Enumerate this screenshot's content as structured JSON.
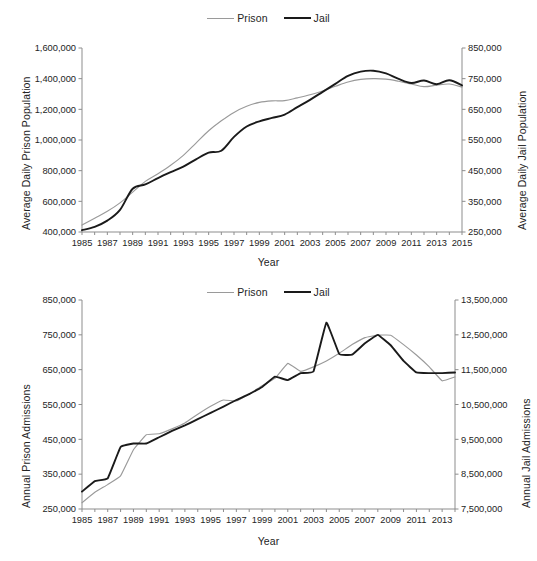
{
  "figures": [
    {
      "id": "average-daily-population",
      "legend": [
        {
          "label": "Prison",
          "color": "#9a9a9a",
          "series": "prison"
        },
        {
          "label": "Jail",
          "color": "#1a1a1a",
          "series": "jail"
        }
      ],
      "chart_data": {
        "type": "line",
        "title": "",
        "xlabel": "Year",
        "ylabel": "Average Daily Prison Population",
        "y2label": "Average Daily Jail Population",
        "grid": false,
        "legend_position": "top-center",
        "x": [
          1985,
          1986,
          1987,
          1988,
          1989,
          1990,
          1991,
          1992,
          1993,
          1994,
          1995,
          1996,
          1997,
          1998,
          1999,
          2000,
          2001,
          2002,
          2003,
          2004,
          2005,
          2006,
          2007,
          2008,
          2009,
          2010,
          2011,
          2012,
          2013,
          2014,
          2015
        ],
        "xlim": [
          1985,
          2015
        ],
        "xticks": [
          1985,
          1987,
          1989,
          1991,
          1993,
          1995,
          1997,
          1999,
          2001,
          2003,
          2005,
          2007,
          2009,
          2011,
          2013,
          2015
        ],
        "xticklabels": [
          "1985",
          "1987",
          "1989",
          "1991",
          "1993",
          "1995",
          "1997",
          "1999",
          "2001",
          "2003",
          "2005",
          "2007",
          "2009",
          "2011",
          "2013",
          "2015"
        ],
        "ylim": [
          400000,
          1600000
        ],
        "yticks": [
          400000,
          600000,
          800000,
          1000000,
          1200000,
          1400000,
          1600000
        ],
        "yticklabels": [
          "400,000",
          "600,000",
          "800,000",
          "1,000,000",
          "1,200,000",
          "1,400,000",
          "1,600,000"
        ],
        "y2lim": [
          250000,
          850000
        ],
        "y2ticks": [
          250000,
          350000,
          450000,
          550000,
          650000,
          750000,
          850000
        ],
        "y2ticklabels": [
          "250,000",
          "350,000",
          "450,000",
          "550,000",
          "650,000",
          "750,000",
          "850,000"
        ],
        "series": [
          {
            "name": "Prison",
            "axis": "left",
            "color": "#9a9a9a",
            "values": [
              445000,
              490000,
              535000,
              590000,
              660000,
              730000,
              780000,
              835000,
              900000,
              980000,
              1060000,
              1125000,
              1180000,
              1220000,
              1245000,
              1255000,
              1257000,
              1275000,
              1295000,
              1320000,
              1350000,
              1378000,
              1395000,
              1400000,
              1397000,
              1383000,
              1365000,
              1348000,
              1358000,
              1365000,
              1345000
            ]
          },
          {
            "name": "Jail",
            "axis": "right",
            "color": "#1a1a1a",
            "values": [
              256000,
              267000,
              287000,
              322000,
              391000,
              405000,
              426000,
              445000,
              463000,
              487000,
              509000,
              515000,
              560000,
              594000,
              611000,
              622000,
              633000,
              657000,
              681000,
              707000,
              733000,
              759000,
              773000,
              776000,
              767000,
              749000,
              736000,
              744000,
              732000,
              745000,
              728000
            ]
          }
        ]
      }
    },
    {
      "id": "annual-admissions",
      "legend": [
        {
          "label": "Prison",
          "color": "#9a9a9a",
          "series": "prison"
        },
        {
          "label": "Jail",
          "color": "#1a1a1a",
          "series": "jail"
        }
      ],
      "chart_data": {
        "type": "line",
        "title": "",
        "xlabel": "Year",
        "ylabel": "Annual Prison Admissions",
        "y2label": "Annual Jail Admissions",
        "grid": false,
        "legend_position": "top-center",
        "x": [
          1985,
          1986,
          1987,
          1988,
          1989,
          1990,
          1991,
          1992,
          1993,
          1994,
          1995,
          1996,
          1997,
          1998,
          1999,
          2000,
          2001,
          2002,
          2003,
          2004,
          2005,
          2006,
          2007,
          2008,
          2009,
          2010,
          2011,
          2012,
          2013,
          2014
        ],
        "xlim": [
          1985,
          2014
        ],
        "xticks": [
          1985,
          1987,
          1989,
          1991,
          1993,
          1995,
          1997,
          1999,
          2001,
          2003,
          2005,
          2007,
          2009,
          2011,
          2013
        ],
        "xticklabels": [
          "1985",
          "1987",
          "1989",
          "1991",
          "1993",
          "1995",
          "1997",
          "1999",
          "2001",
          "2003",
          "2005",
          "2007",
          "2009",
          "2011",
          "2013"
        ],
        "ylim": [
          250000,
          850000
        ],
        "yticks": [
          250000,
          350000,
          450000,
          550000,
          650000,
          750000,
          850000
        ],
        "yticklabels": [
          "250,000",
          "350,000",
          "450,000",
          "550,000",
          "650,000",
          "750,000",
          "850,000"
        ],
        "y2lim": [
          7500000,
          13500000
        ],
        "y2ticks": [
          7500000,
          8500000,
          9500000,
          10500000,
          11500000,
          12500000,
          13500000
        ],
        "y2ticklabels": [
          "7,500,000",
          "8,500,000",
          "9,500,000",
          "10,500,000",
          "11,500,000",
          "12,500,000",
          "13,500,000"
        ],
        "series": [
          {
            "name": "Prison",
            "axis": "left",
            "color": "#9a9a9a",
            "values": [
              268000,
              298000,
              320000,
              345000,
              420000,
              463000,
              466000,
              480000,
              497000,
              522000,
              545000,
              563000,
              560000,
              580000,
              604000,
              625000,
              668000,
              645000,
              658000,
              675000,
              697000,
              722000,
              742000,
              749000,
              749000,
              722000,
              692000,
              658000,
              618000,
              629000
            ]
          },
          {
            "name": "Jail",
            "axis": "right",
            "color": "#1a1a1a",
            "values": [
              8000000,
              8300000,
              8380000,
              9280000,
              9380000,
              9380000,
              9560000,
              9740000,
              9900000,
              10080000,
              10260000,
              10440000,
              10630000,
              10800000,
              11000000,
              11300000,
              11200000,
              11400000,
              11450000,
              12850000,
              11950000,
              11930000,
              12260000,
              12500000,
              12200000,
              11750000,
              11420000,
              11400000,
              11400000,
              11420000
            ]
          }
        ]
      }
    }
  ]
}
